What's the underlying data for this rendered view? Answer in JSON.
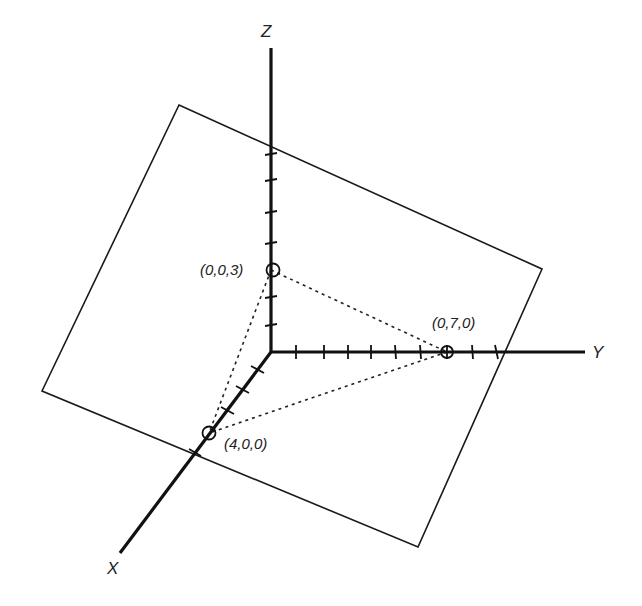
{
  "diagram": {
    "type": "3d-coordinate-plane",
    "axes": {
      "x": {
        "label": "X"
      },
      "y": {
        "label": "Y"
      },
      "z": {
        "label": "Z"
      }
    },
    "points": [
      {
        "id": "p_z",
        "label": "(0,0,3)",
        "coords": [
          0,
          0,
          3
        ]
      },
      {
        "id": "p_y",
        "label": "(0,7,0)",
        "coords": [
          0,
          7,
          0
        ]
      },
      {
        "id": "p_x",
        "label": "(4,0,0)",
        "coords": [
          4,
          0,
          0
        ]
      }
    ],
    "plane_description": "Plane passing through (4,0,0), (0,7,0), (0,0,3) with dotted triangle of intercepts",
    "ticks": {
      "x": 5,
      "y": 9,
      "z": 7
    }
  }
}
